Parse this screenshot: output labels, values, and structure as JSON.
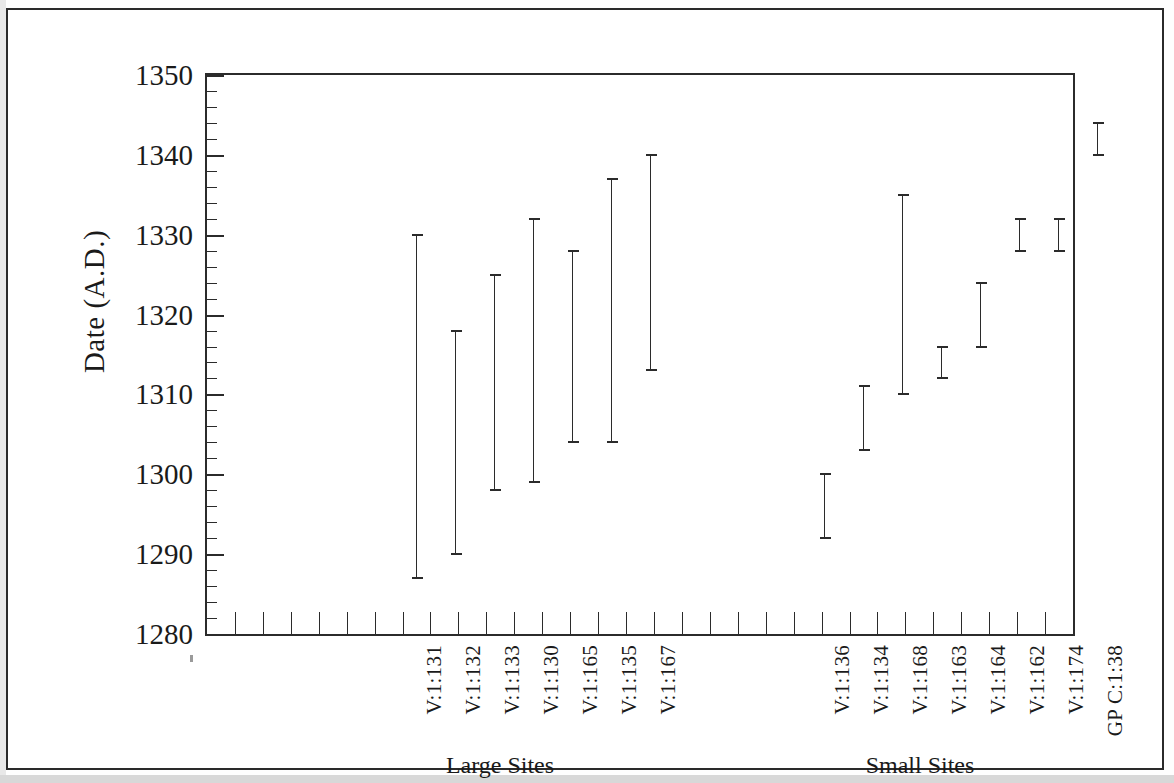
{
  "figure": {
    "y_axis_title": "Date (A.D.)",
    "group_labels": [
      {
        "text": "Large Sites",
        "center_x": 500
      },
      {
        "text": "Small Sites",
        "center_x": 920
      }
    ]
  },
  "chart_data": {
    "type": "bar",
    "subtype": "range-bar (floating bar / interval plot)",
    "title": "",
    "xlabel": "",
    "ylabel": "Date (A.D.)",
    "ylim": [
      1280,
      1350
    ],
    "y_major_step": 10,
    "y_minor_step": 2,
    "grid": false,
    "legend": null,
    "y_tick_labels": [
      "1350",
      "1340",
      "1330",
      "1320",
      "1310",
      "1300",
      "1290",
      "1280"
    ],
    "x_tick_count": 30,
    "groups": [
      {
        "name": "Large Sites",
        "categories": [
          "V:1:131",
          "V:1:132",
          "V:1:133",
          "V:1:130",
          "V:1:165",
          "V:1:135",
          "V:1:167"
        ],
        "intervals": [
          {
            "label": "V:1:131",
            "start": 1287,
            "end": 1330
          },
          {
            "label": "V:1:132",
            "start": 1290,
            "end": 1318
          },
          {
            "label": "V:1:133",
            "start": 1298,
            "end": 1325
          },
          {
            "label": "V:1:130",
            "start": 1299,
            "end": 1332
          },
          {
            "label": "V:1:165",
            "start": 1304,
            "end": 1328
          },
          {
            "label": "V:1:135",
            "start": 1304,
            "end": 1337
          },
          {
            "label": "V:1:167",
            "start": 1313,
            "end": 1340
          }
        ]
      },
      {
        "name": "Small Sites",
        "categories": [
          "V:1:136",
          "V:1:134",
          "V:1:168",
          "V:1:163",
          "V:1:164",
          "V:1:162",
          "V:1:174",
          "GP C:1:38"
        ],
        "intervals": [
          {
            "label": "V:1:136",
            "start": 1292,
            "end": 1300
          },
          {
            "label": "V:1:134",
            "start": 1303,
            "end": 1311
          },
          {
            "label": "V:1:168",
            "start": 1310,
            "end": 1335
          },
          {
            "label": "V:1:163",
            "start": 1312,
            "end": 1316
          },
          {
            "label": "V:1:164",
            "start": 1316,
            "end": 1324
          },
          {
            "label": "V:1:162",
            "start": 1328,
            "end": 1332
          },
          {
            "label": "V:1:174",
            "start": 1328,
            "end": 1332
          },
          {
            "label": "GP C:1:38",
            "start": 1340,
            "end": 1344
          }
        ]
      }
    ],
    "bar_positions": [
      {
        "label": "V:1:131",
        "x": 414
      },
      {
        "label": "V:1:132",
        "x": 453
      },
      {
        "label": "V:1:133",
        "x": 492
      },
      {
        "label": "V:1:130",
        "x": 531
      },
      {
        "label": "V:1:165",
        "x": 570
      },
      {
        "label": "V:1:135",
        "x": 609
      },
      {
        "label": "V:1:167",
        "x": 648
      },
      {
        "label": "V:1:136",
        "x": 822
      },
      {
        "label": "V:1:134",
        "x": 861
      },
      {
        "label": "V:1:168",
        "x": 900
      },
      {
        "label": "V:1:163",
        "x": 939
      },
      {
        "label": "V:1:164",
        "x": 978
      },
      {
        "label": "V:1:162",
        "x": 1017
      },
      {
        "label": "V:1:174",
        "x": 1056
      },
      {
        "label": "GP C:1:38",
        "x": 1095
      }
    ]
  },
  "colors": {
    "ink": "#2b2b2b",
    "paper": "#ffffff",
    "frame": "#2a2a2a"
  }
}
